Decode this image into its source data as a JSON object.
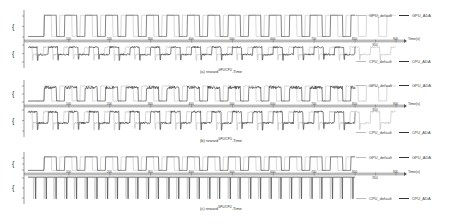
{
  "chart_data": [
    {
      "type": "line",
      "panel": "a",
      "caption": "(a) reward",
      "caption_sup": "GPU/CPU",
      "caption_suffix": "-Time",
      "xlabel": "Time(s)",
      "x_ticks": [
        100,
        200,
        300,
        400,
        500,
        600,
        700,
        800,
        850,
        900
      ],
      "xlim": [
        0,
        900
      ],
      "top": {
        "ylabel": "r_GPU",
        "legend": [
          "GPU_default",
          "GPU_ADA"
        ],
        "pattern": "square",
        "period": 50,
        "duty": 0.6,
        "low": 0.1,
        "high": 0.95,
        "ada_end": 800,
        "default_end": 900,
        "noise": 0.02
      },
      "bottom": {
        "ylabel": "r_CPU",
        "legend": [
          "CPU_default",
          "CPU_ADA"
        ],
        "pattern": "step-noisy",
        "period": 50,
        "low": 0.55,
        "high": 0.2,
        "ada_end": 800,
        "default_end": 900,
        "noise": 0.08
      }
    },
    {
      "type": "line",
      "panel": "b",
      "caption": "(b) reward",
      "caption_sup": "GPU/CPU",
      "caption_suffix": "-Time",
      "xlabel": "Time(s)",
      "x_ticks": [
        100,
        200,
        300,
        400,
        500,
        600,
        700,
        800,
        850,
        900
      ],
      "xlim": [
        0,
        900
      ],
      "top": {
        "ylabel": "r_GPU",
        "legend": [
          "GPU_default",
          "GPU_ADA"
        ],
        "pattern": "square-dense",
        "period": 50,
        "duty": 0.6,
        "low": 0.15,
        "high": 0.9,
        "ada_end": 800,
        "default_end": 900,
        "noise": 0.15
      },
      "bottom": {
        "ylabel": "r_CPU",
        "legend": [
          "CPU_default",
          "CPU_ADA"
        ],
        "pattern": "step-noisy",
        "period": 50,
        "low": 0.6,
        "high": 0.15,
        "ada_end": 800,
        "default_end": 900,
        "noise": 0.08
      }
    },
    {
      "type": "line",
      "panel": "c",
      "caption": "(c) reward",
      "caption_sup": "GPU/CPU",
      "caption_suffix": "-Time",
      "xlabel": "Time(s)",
      "x_ticks": [
        100,
        200,
        300,
        400,
        500,
        600,
        700,
        800,
        850,
        900
      ],
      "xlim": [
        0,
        900
      ],
      "top": {
        "ylabel": "r_GPU",
        "legend": [
          "GPU_default",
          "GPU_ADA"
        ],
        "pattern": "square",
        "period": 50,
        "duty": 0.6,
        "low": 0.1,
        "high": 0.95,
        "ada_end": 800,
        "default_end": 800,
        "noise": 0
      },
      "bottom": {
        "ylabel": "r_CPU",
        "legend": [
          "CPU_default",
          "CPU_ADA"
        ],
        "pattern": "spikes",
        "period": 50,
        "low": 0.05,
        "high": 0.95,
        "ada_end": 800,
        "default_end": 800,
        "noise": 0
      }
    }
  ]
}
